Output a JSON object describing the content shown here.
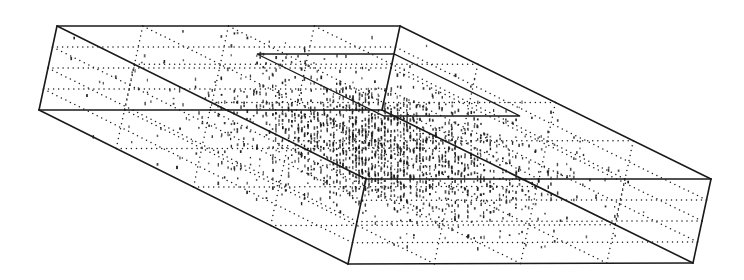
{
  "figure": {
    "type": "3d-wireframe-box-with-point-cloud",
    "background": "#ffffff",
    "ink_color": "#1a1a1a",
    "box": {
      "vertices": {
        "top_back_left": [
          57,
          26
        ],
        "top_back_right": [
          400,
          26
        ],
        "top_front_right": [
          711,
          179
        ],
        "top_front_left": [
          366,
          179
        ],
        "bottom_back_left": [
          39,
          110
        ],
        "bottom_back_right": [
          382,
          110
        ],
        "bottom_front_right": [
          693,
          263
        ],
        "bottom_front_left": [
          348,
          264
        ]
      },
      "edges": [
        [
          "top_back_left",
          "top_back_right"
        ],
        [
          "top_back_right",
          "top_front_right"
        ],
        [
          "top_front_right",
          "top_front_left"
        ],
        [
          "top_front_left",
          "top_back_left"
        ],
        [
          "bottom_back_left",
          "bottom_back_right"
        ],
        [
          "bottom_back_right",
          "bottom_front_right"
        ],
        [
          "bottom_front_right",
          "bottom_front_left"
        ],
        [
          "bottom_front_left",
          "bottom_back_left"
        ],
        [
          "top_back_left",
          "bottom_back_left"
        ],
        [
          "top_back_right",
          "bottom_back_right"
        ],
        [
          "top_front_right",
          "bottom_front_right"
        ],
        [
          "top_front_left",
          "bottom_front_left"
        ]
      ],
      "stroke_width": 1.6
    },
    "inner_region": {
      "vertices": [
        [
          257,
          54
        ],
        [
          394,
          54
        ],
        [
          520,
          116
        ],
        [
          384,
          116
        ]
      ],
      "stroke_width": 1.3
    },
    "grid": {
      "divisions": 4,
      "dot_spacing": 5,
      "dot_radius": 0.75
    },
    "point_cloud": {
      "center": [
        380,
        140
      ],
      "density_peak": 0.9,
      "dot_radius": 0.9,
      "count": 5200,
      "seed": 7
    }
  }
}
